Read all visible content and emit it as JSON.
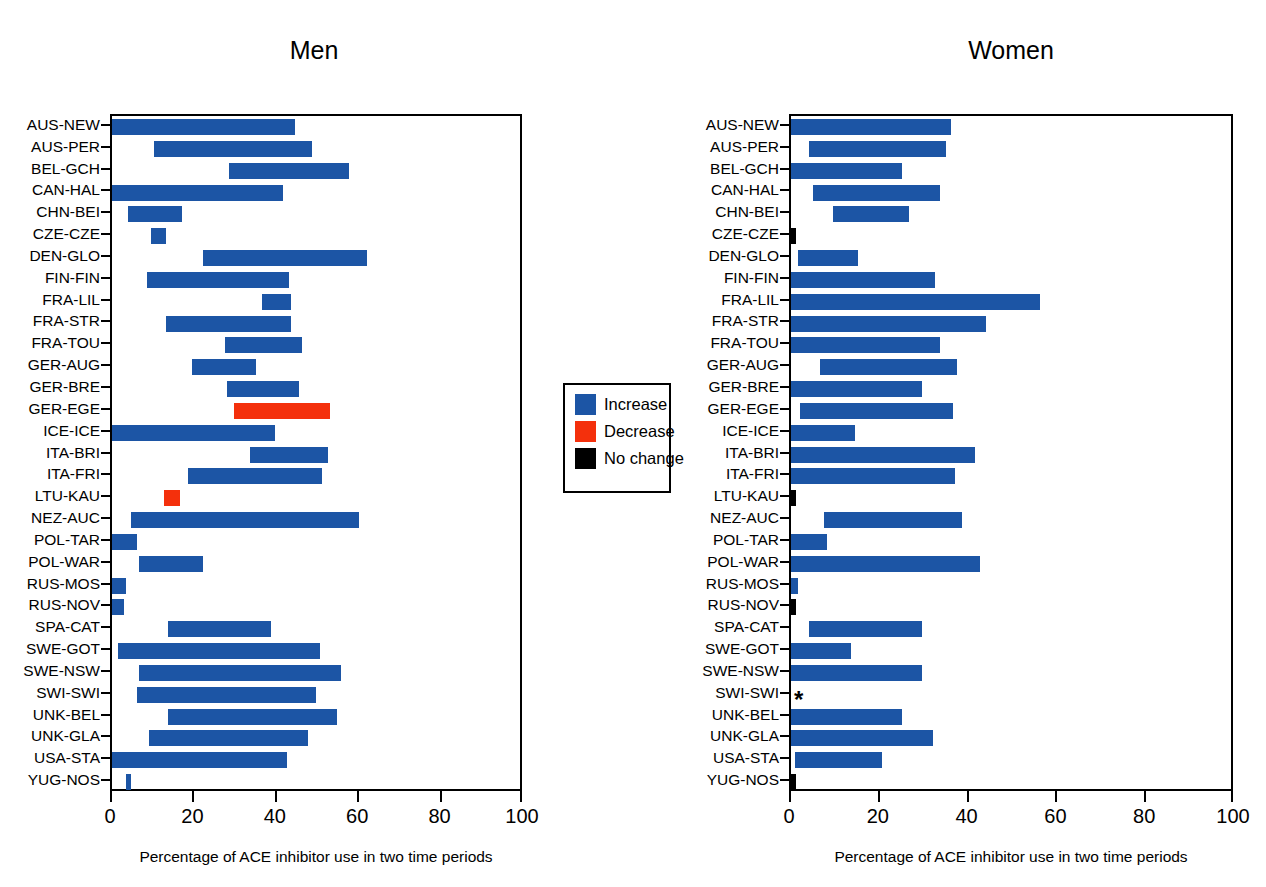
{
  "figure": {
    "cropped_top_title": "",
    "axis_title": "Percentage of ACE inhibitor use in two time periods",
    "colors": {
      "increase": "#1c55a5",
      "decrease": "#f4300c",
      "nochange": "#000000"
    }
  },
  "legend": {
    "items": [
      {
        "label": "Increase",
        "color_key": "increase"
      },
      {
        "label": "Decrease",
        "color_key": "decrease"
      },
      {
        "label": "No change",
        "color_key": "nochange"
      }
    ]
  },
  "chart_data": [
    {
      "type": "bar",
      "orientation": "horizontal-range",
      "title": "Men",
      "xlabel": "Percentage of ACE inhibitor use in two time periods",
      "ylabel": "",
      "xlim": [
        0,
        100
      ],
      "xticks": [
        0,
        20,
        40,
        60,
        80,
        100
      ],
      "xticklabels": [
        "0",
        "20",
        "40",
        "60",
        "80",
        "100"
      ],
      "grid": false,
      "legend_position": "center-between-panels",
      "categories": [
        "AUS-NEW",
        "AUS-PER",
        "BEL-GCH",
        "CAN-HAL",
        "CHN-BEI",
        "CZE-CZE",
        "DEN-GLO",
        "FIN-FIN",
        "FRA-LIL",
        "FRA-STR",
        "FRA-TOU",
        "GER-AUG",
        "GER-BRE",
        "GER-EGE",
        "ICE-ICE",
        "ITA-BRI",
        "ITA-FRI",
        "LTU-KAU",
        "NEZ-AUC",
        "POL-TAR",
        "POL-WAR",
        "RUS-MOS",
        "RUS-NOV",
        "SPA-CAT",
        "SWE-GOT",
        "SWE-NSW",
        "SWI-SWI",
        "UNK-BEL",
        "UNK-GLA",
        "USA-STA",
        "YUG-NOS"
      ],
      "bars": [
        {
          "category": "AUS-NEW",
          "start": 0.0,
          "end": 44.5,
          "change": "increase"
        },
        {
          "category": "AUS-PER",
          "start": 10.3,
          "end": 48.5,
          "change": "increase"
        },
        {
          "category": "BEL-GCH",
          "start": 28.5,
          "end": 57.5,
          "change": "increase"
        },
        {
          "category": "CAN-HAL",
          "start": 0.0,
          "end": 41.5,
          "change": "increase"
        },
        {
          "category": "CHN-BEI",
          "start": 4.0,
          "end": 17.0,
          "change": "increase"
        },
        {
          "category": "CZE-CZE",
          "start": 9.5,
          "end": 13.0,
          "change": "increase"
        },
        {
          "category": "DEN-GLO",
          "start": 22.0,
          "end": 62.0,
          "change": "increase"
        },
        {
          "category": "FIN-FIN",
          "start": 8.5,
          "end": 43.0,
          "change": "increase"
        },
        {
          "category": "FRA-LIL",
          "start": 36.5,
          "end": 43.5,
          "change": "increase"
        },
        {
          "category": "FRA-STR",
          "start": 13.0,
          "end": 43.5,
          "change": "increase"
        },
        {
          "category": "FRA-TOU",
          "start": 27.5,
          "end": 46.0,
          "change": "increase"
        },
        {
          "category": "GER-AUG",
          "start": 19.5,
          "end": 35.0,
          "change": "increase"
        },
        {
          "category": "GER-BRE",
          "start": 28.0,
          "end": 45.5,
          "change": "increase"
        },
        {
          "category": "GER-EGE",
          "start": 29.5,
          "end": 53.0,
          "change": "decrease"
        },
        {
          "category": "ICE-ICE",
          "start": 0.0,
          "end": 39.5,
          "change": "increase"
        },
        {
          "category": "ITA-BRI",
          "start": 33.5,
          "end": 52.5,
          "change": "increase"
        },
        {
          "category": "ITA-FRI",
          "start": 18.5,
          "end": 51.0,
          "change": "increase"
        },
        {
          "category": "LTU-KAU",
          "start": 12.5,
          "end": 16.5,
          "change": "decrease"
        },
        {
          "category": "NEZ-AUC",
          "start": 4.5,
          "end": 60.0,
          "change": "increase"
        },
        {
          "category": "POL-TAR",
          "start": 0.0,
          "end": 6.0,
          "change": "increase"
        },
        {
          "category": "POL-WAR",
          "start": 6.5,
          "end": 22.0,
          "change": "increase"
        },
        {
          "category": "RUS-MOS",
          "start": 0.0,
          "end": 3.5,
          "change": "increase"
        },
        {
          "category": "RUS-NOV",
          "start": 0.0,
          "end": 3.0,
          "change": "increase"
        },
        {
          "category": "SPA-CAT",
          "start": 13.5,
          "end": 38.5,
          "change": "increase"
        },
        {
          "category": "SWE-GOT",
          "start": 1.5,
          "end": 50.5,
          "change": "increase"
        },
        {
          "category": "SWE-NSW",
          "start": 6.5,
          "end": 55.5,
          "change": "increase"
        },
        {
          "category": "SWI-SWI",
          "start": 6.0,
          "end": 49.5,
          "change": "increase"
        },
        {
          "category": "UNK-BEL",
          "start": 13.5,
          "end": 54.5,
          "change": "increase"
        },
        {
          "category": "UNK-GLA",
          "start": 9.0,
          "end": 47.5,
          "change": "increase"
        },
        {
          "category": "USA-STA",
          "start": 0.0,
          "end": 42.5,
          "change": "increase"
        },
        {
          "category": "YUG-NOS",
          "start": 3.5,
          "end": 4.5,
          "change": "increase"
        }
      ],
      "annotations": []
    },
    {
      "type": "bar",
      "orientation": "horizontal-range",
      "title": "Women",
      "xlabel": "Percentage of ACE inhibitor use in two time periods",
      "ylabel": "",
      "xlim": [
        0,
        100
      ],
      "xticks": [
        0,
        20,
        40,
        60,
        80,
        100
      ],
      "xticklabels": [
        "0",
        "20",
        "40",
        "60",
        "80",
        "100"
      ],
      "grid": false,
      "legend_position": "center-between-panels",
      "categories": [
        "AUS-NEW",
        "AUS-PER",
        "BEL-GCH",
        "CAN-HAL",
        "CHN-BEI",
        "CZE-CZE",
        "DEN-GLO",
        "FIN-FIN",
        "FRA-LIL",
        "FRA-STR",
        "FRA-TOU",
        "GER-AUG",
        "GER-BRE",
        "GER-EGE",
        "ICE-ICE",
        "ITA-BRI",
        "ITA-FRI",
        "LTU-KAU",
        "NEZ-AUC",
        "POL-TAR",
        "POL-WAR",
        "RUS-MOS",
        "RUS-NOV",
        "SPA-CAT",
        "SWE-GOT",
        "SWE-NSW",
        "SWI-SWI",
        "UNK-BEL",
        "UNK-GLA",
        "USA-STA",
        "YUG-NOS"
      ],
      "bars": [
        {
          "category": "AUS-NEW",
          "start": 0.0,
          "end": 36.0,
          "change": "increase"
        },
        {
          "category": "AUS-PER",
          "start": 4.0,
          "end": 35.0,
          "change": "increase"
        },
        {
          "category": "BEL-GCH",
          "start": 0.0,
          "end": 25.0,
          "change": "increase"
        },
        {
          "category": "CAN-HAL",
          "start": 5.0,
          "end": 33.5,
          "change": "increase"
        },
        {
          "category": "CHN-BEI",
          "start": 9.5,
          "end": 26.5,
          "change": "increase"
        },
        {
          "category": "CZE-CZE",
          "start": 0.0,
          "end": 1.0,
          "change": "nochange"
        },
        {
          "category": "DEN-GLO",
          "start": 1.5,
          "end": 15.0,
          "change": "increase"
        },
        {
          "category": "FIN-FIN",
          "start": 0.0,
          "end": 32.5,
          "change": "increase"
        },
        {
          "category": "FRA-LIL",
          "start": 0.0,
          "end": 56.0,
          "change": "increase"
        },
        {
          "category": "FRA-STR",
          "start": 0.0,
          "end": 44.0,
          "change": "increase"
        },
        {
          "category": "FRA-TOU",
          "start": 0.0,
          "end": 33.5,
          "change": "increase"
        },
        {
          "category": "GER-AUG",
          "start": 6.5,
          "end": 37.5,
          "change": "increase"
        },
        {
          "category": "GER-BRE",
          "start": 0.0,
          "end": 29.5,
          "change": "increase"
        },
        {
          "category": "GER-EGE",
          "start": 2.0,
          "end": 36.5,
          "change": "increase"
        },
        {
          "category": "ICE-ICE",
          "start": 0.0,
          "end": 14.5,
          "change": "increase"
        },
        {
          "category": "ITA-BRI",
          "start": 0.0,
          "end": 41.5,
          "change": "increase"
        },
        {
          "category": "ITA-FRI",
          "start": 0.0,
          "end": 37.0,
          "change": "increase"
        },
        {
          "category": "LTU-KAU",
          "start": 0.0,
          "end": 1.0,
          "change": "nochange"
        },
        {
          "category": "NEZ-AUC",
          "start": 7.5,
          "end": 38.5,
          "change": "increase"
        },
        {
          "category": "POL-TAR",
          "start": 0.0,
          "end": 8.0,
          "change": "increase"
        },
        {
          "category": "POL-WAR",
          "start": 0.0,
          "end": 42.5,
          "change": "increase"
        },
        {
          "category": "RUS-MOS",
          "start": 0.0,
          "end": 1.5,
          "change": "increase"
        },
        {
          "category": "RUS-NOV",
          "start": 0.0,
          "end": 1.0,
          "change": "nochange"
        },
        {
          "category": "SPA-CAT",
          "start": 4.0,
          "end": 29.5,
          "change": "increase"
        },
        {
          "category": "SWE-GOT",
          "start": 0.0,
          "end": 13.5,
          "change": "increase"
        },
        {
          "category": "SWE-NSW",
          "start": 0.0,
          "end": 29.5,
          "change": "increase"
        },
        {
          "category": "SWI-SWI",
          "start": 0.0,
          "end": 0.0,
          "change": "none"
        },
        {
          "category": "UNK-BEL",
          "start": 0.0,
          "end": 25.0,
          "change": "increase"
        },
        {
          "category": "UNK-GLA",
          "start": 0.0,
          "end": 32.0,
          "change": "increase"
        },
        {
          "category": "USA-STA",
          "start": 1.0,
          "end": 20.5,
          "change": "increase"
        },
        {
          "category": "YUG-NOS",
          "start": 0.0,
          "end": 1.0,
          "change": "nochange"
        }
      ],
      "annotations": [
        {
          "category": "SWI-SWI",
          "symbol": "★",
          "text": "*"
        }
      ]
    }
  ]
}
